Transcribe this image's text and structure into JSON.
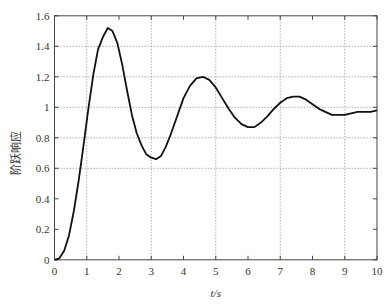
{
  "chart_data": {
    "type": "line",
    "title": "",
    "xlabel": "t/s",
    "ylabel": "阶跃响应",
    "xlim": [
      0,
      10
    ],
    "ylim": [
      0,
      1.6
    ],
    "xticks": [
      0,
      1,
      2,
      3,
      4,
      5,
      6,
      7,
      8,
      9,
      10
    ],
    "xtick_labels": [
      "0",
      "1",
      "2",
      "3",
      "4",
      "5",
      "6",
      "7",
      "8",
      "9",
      "10"
    ],
    "yticks": [
      0,
      0.2,
      0.4,
      0.6,
      0.8,
      1.0,
      1.2,
      1.4,
      1.6
    ],
    "ytick_labels": [
      "0",
      "0.2",
      "0.4",
      "0.6",
      "0.8",
      "1",
      "1.2",
      "1.4",
      "1.6"
    ],
    "grid": {
      "on": true,
      "style": "dotted",
      "x_lines": [
        1,
        3,
        5,
        7,
        9
      ],
      "y_lines": [
        0.6,
        0.8,
        1.0,
        1.2,
        1.4
      ]
    },
    "legend": null,
    "series": [
      {
        "name": "step response",
        "color": "#111111",
        "x": [
          0,
          0.15,
          0.3,
          0.45,
          0.6,
          0.75,
          0.9,
          1.05,
          1.2,
          1.35,
          1.5,
          1.65,
          1.8,
          1.95,
          2.1,
          2.25,
          2.4,
          2.55,
          2.7,
          2.85,
          3.0,
          3.15,
          3.3,
          3.45,
          3.6,
          3.8,
          4.0,
          4.2,
          4.4,
          4.6,
          4.8,
          5.0,
          5.2,
          5.4,
          5.6,
          5.8,
          6.0,
          6.2,
          6.4,
          6.6,
          6.8,
          7.0,
          7.2,
          7.4,
          7.6,
          7.8,
          8.0,
          8.2,
          8.4,
          8.6,
          8.8,
          9.0,
          9.2,
          9.4,
          9.6,
          9.8,
          10.0
        ],
        "values": [
          0,
          0.01,
          0.06,
          0.16,
          0.32,
          0.52,
          0.75,
          0.99,
          1.21,
          1.38,
          1.46,
          1.52,
          1.5,
          1.42,
          1.28,
          1.11,
          0.95,
          0.83,
          0.75,
          0.69,
          0.67,
          0.66,
          0.68,
          0.74,
          0.82,
          0.94,
          1.06,
          1.14,
          1.19,
          1.2,
          1.18,
          1.13,
          1.06,
          0.99,
          0.93,
          0.89,
          0.87,
          0.87,
          0.9,
          0.94,
          0.99,
          1.03,
          1.06,
          1.07,
          1.07,
          1.05,
          1.02,
          0.99,
          0.97,
          0.95,
          0.95,
          0.95,
          0.96,
          0.97,
          0.97,
          0.97,
          0.98
        ]
      }
    ]
  }
}
